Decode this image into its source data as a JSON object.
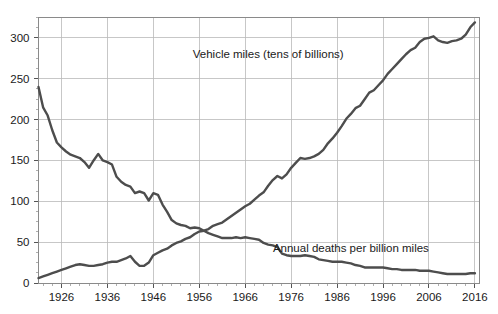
{
  "chart_data": {
    "type": "line",
    "title": "",
    "xlabel": "",
    "ylabel": "",
    "xlim": [
      1921,
      2017
    ],
    "ylim": [
      0,
      325
    ],
    "grid": true,
    "legend_position": "inline-annotation",
    "y_ticks": [
      0,
      50,
      100,
      150,
      200,
      250,
      300
    ],
    "y_tick_labels": [
      "0",
      "50",
      "100",
      "150",
      "200",
      "250",
      "300"
    ],
    "x_ticks": [
      1926,
      1936,
      1946,
      1956,
      1966,
      1976,
      1986,
      1996,
      2006,
      2016
    ],
    "x_tick_labels": [
      "1926",
      "1936",
      "1946",
      "1956",
      "1966",
      "1976",
      "1986",
      "1996",
      "2006",
      "2016"
    ],
    "x": [
      1921,
      1922,
      1923,
      1924,
      1925,
      1926,
      1927,
      1928,
      1929,
      1930,
      1931,
      1932,
      1933,
      1934,
      1935,
      1936,
      1937,
      1938,
      1939,
      1940,
      1941,
      1942,
      1943,
      1944,
      1945,
      1946,
      1947,
      1948,
      1949,
      1950,
      1951,
      1952,
      1953,
      1954,
      1955,
      1956,
      1957,
      1958,
      1959,
      1960,
      1961,
      1962,
      1963,
      1964,
      1965,
      1966,
      1967,
      1968,
      1969,
      1970,
      1971,
      1972,
      1973,
      1974,
      1975,
      1976,
      1977,
      1978,
      1979,
      1980,
      1981,
      1982,
      1983,
      1984,
      1985,
      1986,
      1987,
      1988,
      1989,
      1990,
      1991,
      1992,
      1993,
      1994,
      1995,
      1996,
      1997,
      1998,
      1999,
      2000,
      2001,
      2002,
      2003,
      2004,
      2005,
      2006,
      2007,
      2008,
      2009,
      2010,
      2011,
      2012,
      2013,
      2014,
      2015,
      2016
    ],
    "series": [
      {
        "name": "Annual deaths per billion miles",
        "annotation": "Annual deaths per billion miles",
        "annotation_x": 1989,
        "annotation_y": 38,
        "color": "#4d4d4d",
        "values": [
          240,
          215,
          205,
          187,
          172,
          166,
          161,
          157,
          155,
          153,
          148,
          141,
          150,
          158,
          150,
          148,
          145,
          130,
          124,
          120,
          118,
          110,
          112,
          110,
          101,
          110,
          108,
          96,
          87,
          77,
          73,
          71,
          70,
          67,
          68,
          67,
          64,
          61,
          59,
          57,
          55,
          55,
          55,
          56,
          55,
          56,
          55,
          54,
          53,
          49,
          47,
          46,
          44,
          36,
          34,
          33,
          33,
          33,
          34,
          33,
          32,
          29,
          28,
          27,
          26,
          26,
          26,
          25,
          24,
          22,
          21,
          19,
          19,
          19,
          19,
          19,
          18,
          17,
          17,
          16,
          16,
          16,
          16,
          15,
          15,
          15,
          14,
          13,
          12,
          11,
          11,
          11,
          11,
          11,
          12,
          12
        ]
      },
      {
        "name": "Vehicle miles (tens of billions)",
        "annotation": "Vehicle miles (tens of billions)",
        "annotation_x": 1971,
        "annotation_y": 275,
        "color": "#4d4d4d",
        "values": [
          6,
          8,
          10,
          12,
          14,
          16,
          18,
          20,
          22,
          23,
          22,
          21,
          21,
          22,
          23,
          25,
          26,
          26,
          28,
          30,
          33,
          26,
          21,
          21,
          25,
          34,
          37,
          40,
          42,
          46,
          49,
          51,
          54,
          56,
          60,
          63,
          64,
          66,
          70,
          72,
          74,
          78,
          82,
          86,
          90,
          94,
          97,
          102,
          107,
          111,
          119,
          126,
          131,
          128,
          133,
          141,
          147,
          153,
          152,
          153,
          155,
          158,
          163,
          171,
          177,
          184,
          192,
          201,
          207,
          214,
          217,
          225,
          233,
          236,
          242,
          248,
          256,
          262,
          268,
          274,
          280,
          285,
          288,
          295,
          299,
          300,
          302,
          297,
          295,
          294,
          296,
          297,
          299,
          304,
          313,
          319
        ]
      }
    ]
  }
}
